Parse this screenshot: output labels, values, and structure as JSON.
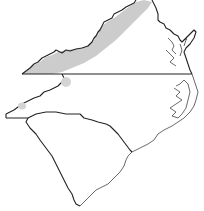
{
  "map": {
    "description": "Outline map of Virginia, North Carolina and South Carolina with shaded range region",
    "regions": [
      {
        "name": "Virginia",
        "shaded": "partial"
      },
      {
        "name": "North Carolina",
        "shaded": "small patches"
      },
      {
        "name": "South Carolina",
        "shaded": "none"
      }
    ],
    "colors": {
      "shade": "#cccccc",
      "outline": "#222222",
      "background": "#ffffff"
    }
  }
}
